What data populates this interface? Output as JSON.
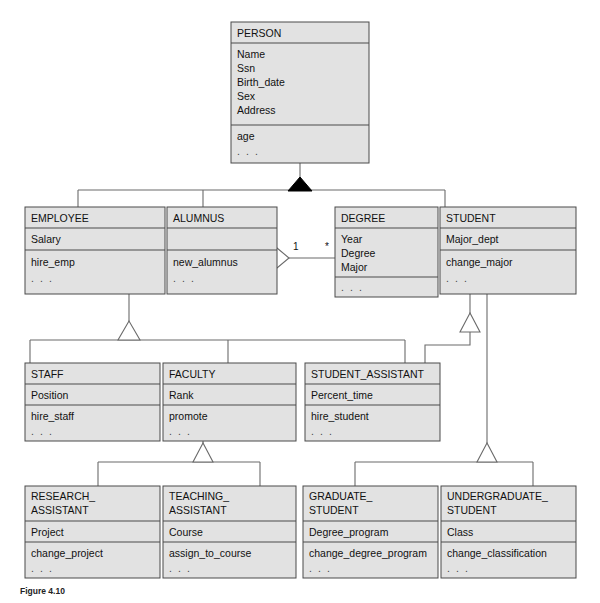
{
  "figure": {
    "caption": "Figure 4.10"
  },
  "diagram": {
    "colors": {
      "box_fill": "#e2e2e2",
      "box_stroke": "#4a4a4a",
      "connector": "#6b6b6b",
      "page_background": "#ffffff",
      "filled_triangle": "#000000"
    },
    "ellipsis": ". . .",
    "classes": [
      {
        "id": "person",
        "name": "PERSON",
        "attributes": [
          "Name",
          "Ssn",
          "Birth_date",
          "Sex",
          "Address"
        ],
        "operations": [
          "age",
          ". . ."
        ]
      },
      {
        "id": "employee",
        "name": "EMPLOYEE",
        "attributes": [
          "Salary"
        ],
        "operations": [
          "hire_emp",
          ". . ."
        ]
      },
      {
        "id": "alumnus",
        "name": "ALUMNUS",
        "attributes": [
          ""
        ],
        "operations": [
          "new_alumnus",
          ". . ."
        ]
      },
      {
        "id": "degree",
        "name": "DEGREE",
        "attributes": [
          "Year",
          "Degree",
          "Major"
        ],
        "operations": [
          ". . ."
        ]
      },
      {
        "id": "student",
        "name": "STUDENT",
        "attributes": [
          "Major_dept"
        ],
        "operations": [
          "change_major",
          ". . ."
        ]
      },
      {
        "id": "staff",
        "name": "STAFF",
        "attributes": [
          "Position"
        ],
        "operations": [
          "hire_staff",
          ". . ."
        ]
      },
      {
        "id": "faculty",
        "name": "FACULTY",
        "attributes": [
          "Rank"
        ],
        "operations": [
          "promote",
          ". . ."
        ]
      },
      {
        "id": "student_assistant",
        "name": "STUDENT_ASSISTANT",
        "attributes": [
          "Percent_time"
        ],
        "operations": [
          "hire_student",
          ". . ."
        ]
      },
      {
        "id": "research_assistant",
        "name": "RESEARCH_\nASSISTANT",
        "name_lines": [
          "RESEARCH_",
          "ASSISTANT"
        ],
        "attributes": [
          "Project"
        ],
        "operations": [
          "change_project",
          ". . ."
        ]
      },
      {
        "id": "teaching_assistant",
        "name": "TEACHING_\nASSISTANT",
        "name_lines": [
          "TEACHING_",
          "ASSISTANT"
        ],
        "attributes": [
          "Course"
        ],
        "operations": [
          "assign_to_course",
          ". . ."
        ]
      },
      {
        "id": "graduate_student",
        "name": "GRADUATE_\nSTUDENT",
        "name_lines": [
          "GRADUATE_",
          "STUDENT"
        ],
        "attributes": [
          "Degree_program"
        ],
        "operations": [
          "change_degree_program",
          ". . ."
        ]
      },
      {
        "id": "undergraduate_student",
        "name": "UNDERGRADUATE_\nSTUDENT",
        "name_lines": [
          "UNDERGRADUATE_",
          "STUDENT"
        ],
        "attributes": [
          "Class"
        ],
        "operations": [
          "change_classification",
          ". . ."
        ]
      }
    ],
    "relationships": [
      {
        "id": "person-generalization",
        "type": "generalization",
        "marker": "filled-triangle",
        "parent": "PERSON",
        "children": [
          "EMPLOYEE",
          "ALUMNUS",
          "STUDENT"
        ]
      },
      {
        "id": "employee-generalization",
        "type": "generalization",
        "marker": "hollow-triangle",
        "parent": "EMPLOYEE",
        "children": [
          "STAFF",
          "FACULTY",
          "STUDENT_ASSISTANT"
        ]
      },
      {
        "id": "student-generalization",
        "type": "generalization",
        "marker": "hollow-triangle",
        "parent": "STUDENT",
        "children": [
          "STUDENT_ASSISTANT"
        ]
      },
      {
        "id": "faculty-generalization",
        "type": "generalization",
        "marker": "hollow-triangle",
        "parent": "FACULTY",
        "children": [
          "RESEARCH_ASSISTANT",
          "TEACHING_ASSISTANT"
        ]
      },
      {
        "id": "student-subclass-generalization",
        "type": "generalization",
        "marker": "hollow-triangle",
        "parent": "STUDENT",
        "children": [
          "GRADUATE_STUDENT",
          "UNDERGRADUATE_STUDENT"
        ]
      },
      {
        "id": "alumnus-degree-aggregation",
        "type": "aggregation",
        "marker": "hollow-diamond",
        "from": "ALUMNUS",
        "to": "DEGREE",
        "from_multiplicity": "1",
        "to_multiplicity": "*"
      }
    ],
    "multiplicities": {
      "alumnus_side": "1",
      "degree_side": "*"
    }
  }
}
